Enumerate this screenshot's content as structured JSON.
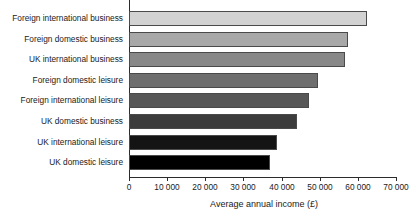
{
  "chart_data": {
    "type": "bar",
    "orientation": "horizontal",
    "title": "",
    "xlabel": "Average annual income (£)",
    "ylabel": "",
    "categories": [
      "Foreign international business",
      "Foreign domestic business",
      "UK international business",
      "Foreign domestic leisure",
      "Foreign international leisure",
      "UK domestic business",
      "UK international leisure",
      "UK domestic leisure"
    ],
    "values": [
      62400,
      57400,
      56600,
      49600,
      47200,
      44000,
      38800,
      37000
    ],
    "bar_colors": [
      "#d2d2d2",
      "#a8a8a8",
      "#888888",
      "#6e6e6e",
      "#575757",
      "#3c3c3c",
      "#141414",
      "#000000"
    ],
    "xlim": [
      0,
      70000
    ],
    "xticks": [
      0,
      10000,
      20000,
      30000,
      40000,
      50000,
      60000,
      70000
    ],
    "xtick_labels": [
      "0",
      "10 000",
      "20 000",
      "30 000",
      "40 000",
      "50 000",
      "60 000",
      "70 000"
    ],
    "grid": false,
    "legend": false
  }
}
